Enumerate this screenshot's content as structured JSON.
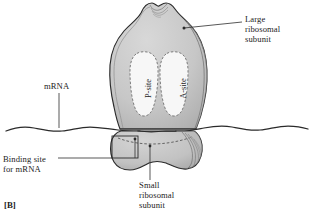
{
  "figure": {
    "tag": "[B]",
    "background_color": "#ffffff",
    "ink_color": "#1c1c1c"
  },
  "labels": {
    "large_subunit": "Large\nribosomal\nsubunit",
    "small_subunit": "Small\nribosomal\nsubunit",
    "mrna": "mRNA",
    "binding_site": "Binding site\nfor mRNA",
    "p_site": "P-site",
    "a_site": "A-site"
  },
  "icons": {
    "large_subunit_shape": "large-ribosomal-subunit-shape",
    "small_subunit_shape": "small-ribosomal-subunit-shape",
    "mrna_strand": "mrna-wavy-strand",
    "binding_site_box": "binding-site-rectangle",
    "p_site_cavity": "p-site-cavity",
    "a_site_cavity": "a-site-cavity"
  },
  "colors": {
    "subunit_fill": "#c9c9c9",
    "subunit_fill_dark": "#b2b2b2",
    "cavity_fill": "#f7f7f7",
    "outline": "#2a2a2a",
    "hatch": "#6e6e6e",
    "leader": "#3a3a3a"
  }
}
